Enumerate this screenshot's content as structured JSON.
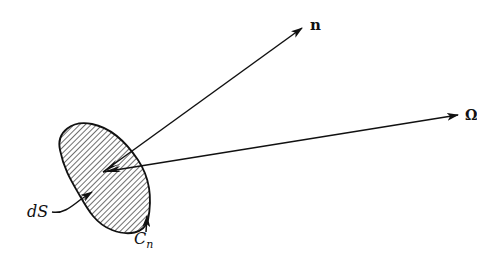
{
  "diagram": {
    "labels": {
      "normal_vector": "n",
      "direction_vector": "Ω",
      "surface_element": "dS",
      "boundary_curve": "C",
      "boundary_curve_subscript": "n"
    },
    "colors": {
      "ink": "#111111",
      "background": "#ffffff"
    }
  }
}
